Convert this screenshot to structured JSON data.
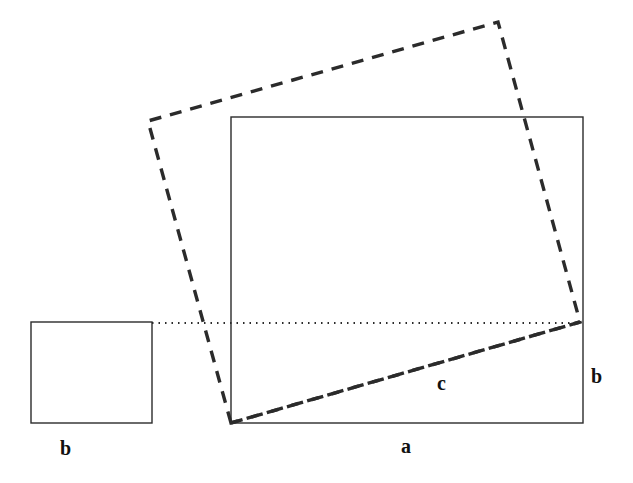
{
  "figure": {
    "kind": "geometry-diagram",
    "background_color": "#ffffff",
    "stroke_color": "#2b2b2b",
    "label_color": "#111111",
    "canvas": {
      "width": 633,
      "height": 483
    }
  },
  "shapes": {
    "small_square": {
      "name": "small-square",
      "style": "solid",
      "x": 31,
      "y": 322,
      "width": 121,
      "height": 101,
      "stroke_width": 1.4
    },
    "large_rectangle": {
      "name": "large-rectangle",
      "style": "solid",
      "x": 231,
      "y": 117,
      "width": 352,
      "height": 306,
      "stroke_width": 1.4
    },
    "dotted_line": {
      "name": "dotted-reference-line",
      "style": "dotted",
      "x1": 152,
      "y1": 323,
      "x2": 580,
      "y2": 323,
      "stroke_width": 2.2,
      "dash": "1.5 5"
    },
    "tilted_square": {
      "name": "tilted-dashed-square",
      "style": "dashed",
      "stroke_width": 3.4,
      "dash": "12 9",
      "points": "231,423 148,121 498,22 580,322",
      "vertices": [
        {
          "label": "bottom",
          "x": 231,
          "y": 423
        },
        {
          "label": "left",
          "x": 148,
          "y": 121
        },
        {
          "label": "top",
          "x": 498,
          "y": 22
        },
        {
          "label": "right",
          "x": 580,
          "y": 322
        }
      ]
    },
    "hypotenuse": {
      "name": "hypotenuse-segment",
      "style": "dashed",
      "x1": 231,
      "y1": 423,
      "x2": 580,
      "y2": 322,
      "stroke_width": 3.4,
      "dash": "12 9"
    }
  },
  "labels": [
    {
      "id": "b-left",
      "name": "label-b-left",
      "text": "b",
      "x": 60,
      "y": 438
    },
    {
      "id": "a-bottom",
      "name": "label-a-bottom",
      "text": "a",
      "x": 401,
      "y": 436
    },
    {
      "id": "c-middle",
      "name": "label-c-middle",
      "text": "c",
      "x": 437,
      "y": 373
    },
    {
      "id": "b-right",
      "name": "label-b-right",
      "text": "b",
      "x": 591,
      "y": 366
    }
  ]
}
